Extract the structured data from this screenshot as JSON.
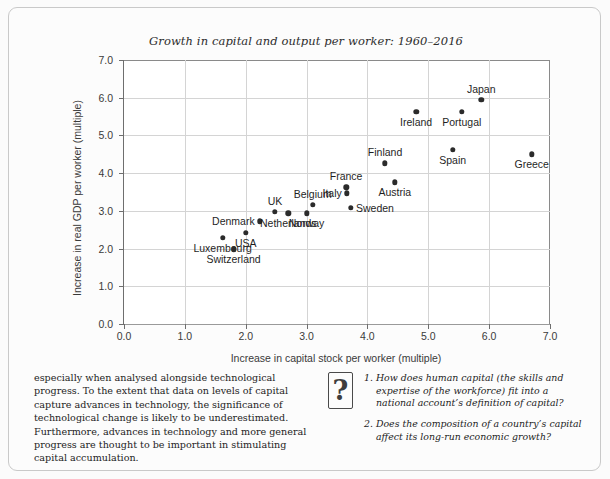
{
  "chart_data": {
    "type": "scatter",
    "title": "Growth in capital and output per worker: 1960–2016",
    "xlabel": "Increase in capital stock per worker (multiple)",
    "ylabel": "Increase in real GDP per worker (multiple)",
    "xlim": [
      0.0,
      7.0
    ],
    "ylim": [
      0.0,
      7.0
    ],
    "xticks": [
      "0.0",
      "1.0",
      "2.0",
      "3.0",
      "4.0",
      "5.0",
      "6.0",
      "7.0"
    ],
    "yticks": [
      "0.0",
      "1.0",
      "2.0",
      "3.0",
      "4.0",
      "5.0",
      "6.0",
      "7.0"
    ],
    "grid": true,
    "legend": "none",
    "point_color": "#2b2b2b",
    "points": [
      {
        "label": "Luxembourg",
        "x": 1.62,
        "y": 2.28,
        "pos": "below"
      },
      {
        "label": "Switzerland",
        "x": 1.8,
        "y": 1.98,
        "pos": "below"
      },
      {
        "label": "USA",
        "x": 2.0,
        "y": 2.42,
        "pos": "below"
      },
      {
        "label": "Denmark",
        "x": 2.23,
        "y": 2.72,
        "pos": "left"
      },
      {
        "label": "UK",
        "x": 2.48,
        "y": 2.97,
        "pos": "above"
      },
      {
        "label": "Netherlands",
        "x": 2.7,
        "y": 2.93,
        "pos": "below"
      },
      {
        "label": "Belgium",
        "x": 3.1,
        "y": 3.16,
        "pos": "above"
      },
      {
        "label": "Norway",
        "x": 3.0,
        "y": 2.93,
        "pos": "below"
      },
      {
        "label": "Italy",
        "x": 3.66,
        "y": 3.47,
        "pos": "left"
      },
      {
        "label": "France",
        "x": 3.65,
        "y": 3.62,
        "pos": "above"
      },
      {
        "label": "Sweden",
        "x": 3.73,
        "y": 3.08,
        "pos": "right"
      },
      {
        "label": "Finland",
        "x": 4.29,
        "y": 4.26,
        "pos": "above"
      },
      {
        "label": "Austria",
        "x": 4.45,
        "y": 3.76,
        "pos": "below"
      },
      {
        "label": "Ireland",
        "x": 4.8,
        "y": 5.62,
        "pos": "below"
      },
      {
        "label": "Spain",
        "x": 5.4,
        "y": 4.62,
        "pos": "below"
      },
      {
        "label": "Portugal",
        "x": 5.55,
        "y": 5.62,
        "pos": "below"
      },
      {
        "label": "Japan",
        "x": 5.87,
        "y": 5.95,
        "pos": "above"
      },
      {
        "label": "Greece",
        "x": 6.7,
        "y": 4.5,
        "pos": "below"
      }
    ]
  },
  "footer": {
    "body_text": "especially when analysed alongside technological progress. To the extent that data on levels of capital capture advances in technology, the significance of technological change is likely to be underestimated. Furthermore, advances in technology and more general progress are thought to be important in stimulating capital accumulation.",
    "question_icon": "?",
    "questions": [
      {
        "number": "1.",
        "text": "How does human capital (the skills and expertise of the workforce) fit into a national account’s definition of capital?"
      },
      {
        "number": "2.",
        "text": "Does the composition of a country’s capital affect its long-run economic growth?"
      }
    ]
  }
}
